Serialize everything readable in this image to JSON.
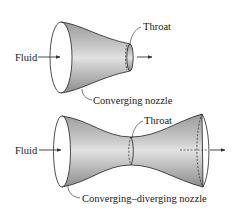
{
  "figure": {
    "top": {
      "name": "Converging nozzle",
      "labels": {
        "fluid": "Fluid",
        "throat": "Throat",
        "caption": "Converging nozzle"
      }
    },
    "bottom": {
      "name": "Converging–diverging nozzle",
      "labels": {
        "fluid": "Fluid",
        "throat": "Throat",
        "caption": "Converging–diverging nozzle"
      }
    },
    "colors": {
      "stroke": "#222222",
      "shade_dark": "#8a8a8a",
      "shade_light": "#e6e6e6",
      "background": "#ffffff"
    }
  }
}
